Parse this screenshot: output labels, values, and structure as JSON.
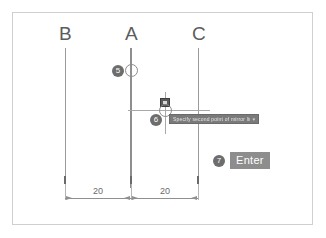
{
  "figure": {
    "type": "cad-step-diagram",
    "lines": [
      {
        "label": "B",
        "x": 65
      },
      {
        "label": "A",
        "x": 131
      },
      {
        "label": "C",
        "x": 198
      }
    ],
    "steps": [
      {
        "number": "5",
        "meaning": "pick-point-on-line-A"
      },
      {
        "number": "6",
        "meaning": "pick-point-on-line-C"
      },
      {
        "number": "7",
        "meaning": "press-enter"
      }
    ],
    "cursor": {
      "osnap_marker": "intersection-snap-icon",
      "aperture": "crosshair-aperture-circle"
    },
    "tooltip": {
      "text": "Specify second point of mirror line:",
      "trailing_icon": "▾"
    },
    "key_hint": {
      "label": "Enter"
    },
    "dimensions": [
      {
        "value": "20",
        "from": "B",
        "to": "A"
      },
      {
        "value": "20",
        "from": "A",
        "to": "C"
      }
    ],
    "colors": {
      "frame": "#cfcfcf",
      "line": "#9b9b9b",
      "badge": "#6d6d6d",
      "tooltip_bg": "#7a7a7a",
      "key_bg": "#8d8d8d",
      "dim": "#8f8f8f",
      "text": "#5c5c5c"
    }
  }
}
